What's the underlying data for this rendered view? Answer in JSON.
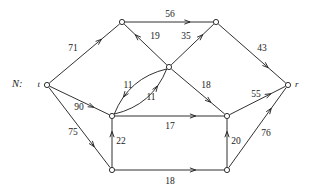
{
  "diagram": {
    "name_label": "N:",
    "type": "directed-weighted-network",
    "width": 310,
    "height": 196,
    "line_color": "#1a1a1a",
    "background_color": "#ffffff",
    "nodes": [
      {
        "id": "t",
        "label": "t",
        "label_side": "left",
        "x": 47,
        "y": 85,
        "r": 2.6
      },
      {
        "id": "a",
        "label": "",
        "label_side": "none",
        "x": 122,
        "y": 22,
        "r": 2.6
      },
      {
        "id": "b",
        "label": "",
        "label_side": "none",
        "x": 216,
        "y": 22,
        "r": 2.6
      },
      {
        "id": "c",
        "label": "",
        "label_side": "none",
        "x": 169,
        "y": 67,
        "r": 2.6
      },
      {
        "id": "d",
        "label": "",
        "label_side": "none",
        "x": 112,
        "y": 116,
        "r": 2.6
      },
      {
        "id": "e",
        "label": "",
        "label_side": "none",
        "x": 227,
        "y": 116,
        "r": 2.6
      },
      {
        "id": "f",
        "label": "",
        "label_side": "none",
        "x": 112,
        "y": 170,
        "r": 2.6
      },
      {
        "id": "g",
        "label": "",
        "label_side": "none",
        "x": 227,
        "y": 170,
        "r": 2.6
      },
      {
        "id": "r",
        "label": "r",
        "label_side": "right",
        "x": 288,
        "y": 85,
        "r": 2.6
      }
    ],
    "edges": [
      {
        "id": "t-a",
        "from": "t",
        "to": "a",
        "weight": "71",
        "lx": 73,
        "ly": 49,
        "curve": 0
      },
      {
        "id": "a-b",
        "from": "a",
        "to": "b",
        "weight": "56",
        "lx": 170,
        "ly": 15,
        "curve": 0
      },
      {
        "id": "c-a",
        "from": "c",
        "to": "a",
        "weight": "19",
        "lx": 155,
        "ly": 37,
        "curve": 0
      },
      {
        "id": "c-b",
        "from": "c",
        "to": "b",
        "weight": "35",
        "lx": 186,
        "ly": 37,
        "curve": 0
      },
      {
        "id": "b-r",
        "from": "b",
        "to": "r",
        "weight": "43",
        "lx": 262,
        "ly": 49,
        "curve": 0
      },
      {
        "id": "d-c",
        "from": "d",
        "to": "c",
        "weight": "11",
        "lx": 128,
        "ly": 86,
        "curve": 9
      },
      {
        "id": "c-d",
        "from": "c",
        "to": "d",
        "weight": "11",
        "lx": 151,
        "ly": 98,
        "curve": 9
      },
      {
        "id": "c-e",
        "from": "c",
        "to": "e",
        "weight": "18",
        "lx": 206,
        "ly": 86,
        "curve": 0
      },
      {
        "id": "e-r",
        "from": "e",
        "to": "r",
        "weight": "55",
        "lx": 256,
        "ly": 95,
        "curve": 0
      },
      {
        "id": "t-d",
        "from": "t",
        "to": "d",
        "weight": "90",
        "lx": 79,
        "ly": 108,
        "curve": 0
      },
      {
        "id": "d-e",
        "from": "d",
        "to": "e",
        "weight": "17",
        "lx": 170,
        "ly": 127,
        "curve": 0
      },
      {
        "id": "t-f",
        "from": "t",
        "to": "f",
        "weight": "75",
        "lx": 73,
        "ly": 133,
        "curve": 0
      },
      {
        "id": "f-d",
        "from": "f",
        "to": "d",
        "weight": "22",
        "lx": 121,
        "ly": 142,
        "curve": 0
      },
      {
        "id": "g-e",
        "from": "g",
        "to": "e",
        "weight": "20",
        "lx": 236,
        "ly": 142,
        "curve": 0
      },
      {
        "id": "g-r",
        "from": "g",
        "to": "r",
        "weight": "76",
        "lx": 266,
        "ly": 134,
        "curve": 0
      },
      {
        "id": "f-g",
        "from": "f",
        "to": "g",
        "weight": "18",
        "lx": 170,
        "ly": 182,
        "curve": 0
      }
    ]
  }
}
